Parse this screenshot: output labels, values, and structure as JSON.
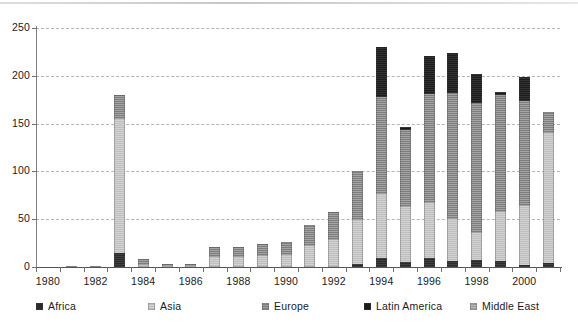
{
  "chart_data": {
    "type": "bar",
    "stacked": true,
    "title": "",
    "subtitle": "",
    "xlabel": "",
    "ylabel": "",
    "ylim": [
      0,
      250
    ],
    "yticks": [
      0,
      50,
      100,
      150,
      200,
      250
    ],
    "grid": true,
    "legend_position": "bottom",
    "categories": [
      "1980",
      "1981",
      "1982",
      "1983",
      "1984",
      "1985",
      "1986",
      "1987",
      "1988",
      "1989",
      "1990",
      "1991",
      "1992",
      "1993",
      "1994",
      "1995",
      "1996",
      "1997",
      "1998",
      "1999",
      "2000",
      "2001"
    ],
    "xtick_labels": [
      "1980",
      "1982",
      "1984",
      "1986",
      "1988",
      "1990",
      "1992",
      "1994",
      "1996",
      "1998",
      "2000"
    ],
    "series": [
      {
        "name": "Africa",
        "color": "#2b2b2b",
        "values": [
          0,
          0,
          0,
          15,
          0,
          0,
          0,
          0,
          0,
          0,
          0,
          0,
          0,
          3,
          9,
          5,
          9,
          6,
          7,
          6,
          2,
          4
        ]
      },
      {
        "name": "Asia",
        "color": "#bfbfbf",
        "values": [
          0,
          1,
          1,
          140,
          2,
          1,
          1,
          10,
          10,
          12,
          13,
          22,
          28,
          46,
          67,
          58,
          58,
          44,
          29,
          52,
          62,
          136
        ]
      },
      {
        "name": "Europe",
        "color": "#7d7d7d",
        "values": [
          0,
          0,
          0,
          25,
          6,
          2,
          2,
          11,
          11,
          12,
          13,
          22,
          30,
          51,
          102,
          80,
          114,
          132,
          136,
          122,
          110,
          22
        ]
      },
      {
        "name": "Latin America",
        "color": "#1c1c1c",
        "values": [
          0,
          0,
          0,
          0,
          0,
          0,
          0,
          0,
          0,
          0,
          0,
          0,
          0,
          0,
          52,
          3,
          40,
          42,
          30,
          3,
          25,
          0
        ]
      },
      {
        "name": "Middle East",
        "color": "#9a9a9a",
        "values": [
          0,
          0,
          0,
          0,
          0,
          0,
          0,
          0,
          0,
          0,
          0,
          0,
          0,
          0,
          0,
          0,
          0,
          0,
          0,
          0,
          0,
          0
        ]
      }
    ],
    "totals": [
      0,
      1,
      1,
      180,
      8,
      3,
      3,
      21,
      21,
      24,
      26,
      44,
      58,
      100,
      230,
      146,
      221,
      224,
      202,
      183,
      199,
      162
    ]
  },
  "legend": {
    "items": [
      {
        "label": "Africa",
        "key": "africa"
      },
      {
        "label": "Asia",
        "key": "asia"
      },
      {
        "label": "Europe",
        "key": "europe"
      },
      {
        "label": "Latin America",
        "key": "latin"
      },
      {
        "label": "Middle East",
        "key": "mideast"
      }
    ]
  }
}
